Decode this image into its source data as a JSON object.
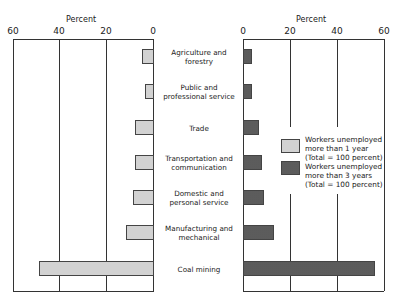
{
  "chart_data": {
    "type": "bar",
    "orientation": "horizontal-butterfly",
    "title": "",
    "categories": [
      "Agriculture and forestry",
      "Public and professional service",
      "Trade",
      "Transportation and communication",
      "Domestic and personal service",
      "Manufacturing and mechanical",
      "Coal mining"
    ],
    "series": [
      {
        "name": "Workers unemployed more than 1 year (Total = 100 percent)",
        "side": "left",
        "pattern": "light-gray",
        "values": [
          5,
          4,
          8,
          8,
          9,
          12,
          49
        ]
      },
      {
        "name": "Workers unemployed more than 3 years (Total = 100 percent)",
        "side": "right",
        "pattern": "dark-stipple",
        "values": [
          4,
          4,
          7,
          8,
          9,
          13,
          56
        ]
      }
    ],
    "left_axis": {
      "label": "Percent",
      "ticks": [
        "60",
        "40",
        "20",
        "0"
      ],
      "range": [
        60,
        0
      ]
    },
    "right_axis": {
      "label": "Percent",
      "ticks": [
        "0",
        "20",
        "40",
        "60"
      ],
      "range": [
        0,
        60
      ]
    },
    "xlabel": "Percent",
    "ylabel": "",
    "grid": true,
    "legend_position": "right-panel-middle"
  },
  "labels": {
    "left_axis_title": "Percent",
    "right_axis_title": "Percent",
    "left_ticks": [
      "60",
      "40",
      "20",
      "0"
    ],
    "right_ticks": [
      "0",
      "20",
      "40",
      "60"
    ],
    "categories": [
      [
        "Agriculture and",
        "forestry"
      ],
      [
        "Public and",
        "professional service"
      ],
      [
        "Trade"
      ],
      [
        "Transportation and",
        "communication"
      ],
      [
        "Domestic and",
        "personal service"
      ],
      [
        "Manufacturing and",
        "mechanical"
      ],
      [
        "Coal mining"
      ]
    ],
    "legend": [
      [
        "Workers unemployed",
        "more than 1 year",
        "(Total = 100 percent)"
      ],
      [
        "Workers unemployed",
        "more than 3 years",
        "(Total = 100 percent)"
      ]
    ]
  },
  "colors": {
    "bar_1yr": "#d2d2d2",
    "bar_3yr": "#9a9a9a",
    "axis": "#333333",
    "background": "#ffffff"
  }
}
